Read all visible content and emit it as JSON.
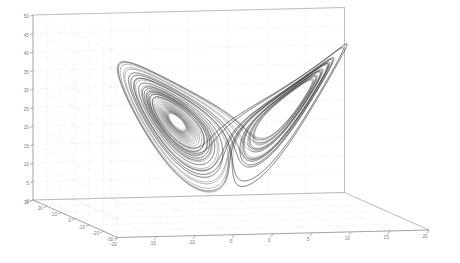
{
  "figure": {
    "title": "",
    "background_color": "#ffffff",
    "axis_color": "#808080",
    "grid_color": "#c8c8c8",
    "curve_color": "#1a1a1a",
    "width": 460,
    "height": 263
  },
  "chart_data": {
    "type": "line",
    "projection": "3d",
    "xlabel": "",
    "ylabel": "",
    "zlabel": "",
    "grid": true,
    "legend": null,
    "xlim": [
      -20,
      20
    ],
    "ylim": [
      -30,
      30
    ],
    "zlim": [
      0,
      50
    ],
    "xticks": [
      -20,
      -15,
      -10,
      -5,
      0,
      5,
      10,
      15,
      20
    ],
    "xticklabels": [
      "-20",
      "-15",
      "-10",
      "-5",
      "0",
      "5",
      "10",
      "15",
      "20"
    ],
    "yticks": [
      30,
      20,
      10,
      0,
      -10,
      -20,
      -30
    ],
    "yticklabels": [
      "30",
      "20",
      "10",
      "0",
      "-10",
      "-20",
      "-30"
    ],
    "zticks": [
      0,
      5,
      10,
      15,
      20,
      25,
      30,
      35,
      40,
      45,
      50
    ],
    "zticklabels": [
      "0",
      "5",
      "10",
      "15",
      "20",
      "25",
      "30",
      "35",
      "40",
      "45",
      "50"
    ],
    "system": {
      "name": "Lorenz",
      "sigma": 10,
      "rho": 28,
      "beta": 2.6666666667,
      "initial_state": [
        1,
        1,
        1
      ],
      "dt": 0.006,
      "steps": 9000
    },
    "series": [
      {
        "name": "trajectory",
        "color": "#1a1a1a",
        "linewidth": 0.35,
        "description": "Single chaotic trajectory winding around two unstable fixed points, forming the classic two-lobed butterfly shape."
      }
    ],
    "fixed_points": [
      {
        "label": "C+",
        "x": 8.485,
        "y": 8.485,
        "z": 27
      },
      {
        "label": "C-",
        "x": -8.485,
        "y": -8.485,
        "z": 27
      }
    ]
  }
}
